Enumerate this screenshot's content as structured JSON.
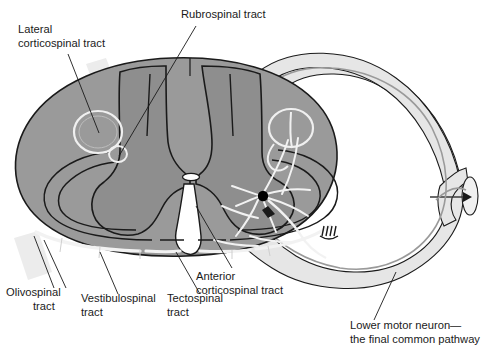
{
  "figure": {
    "background_color": "#ffffff"
  },
  "colors": {
    "white_matter": "#9a9a9a",
    "gray_matter": "#8e8e8e",
    "nerve_root": "#e6e6e6",
    "tract_highlight": "#ececec",
    "outline": "#1a1a1a",
    "tract_line": "#f2f2f2",
    "neuron_soma": "#000000",
    "label_text": "#1a1a1a",
    "leader_line": "#1a1a1a"
  },
  "labels": [
    {
      "id": "lateral-corticospinal-tract",
      "lines": [
        "Lateral",
        "corticospinal tract"
      ],
      "x": 18,
      "y": 33,
      "anchor": "start"
    },
    {
      "id": "rubrospinal-tract",
      "lines": [
        "Rubrospinal tract"
      ],
      "x": 181,
      "y": 18,
      "anchor": "start"
    },
    {
      "id": "anterior-corticospinal-tract",
      "lines": [
        "Anterior",
        "corticospinal tract"
      ],
      "x": 196,
      "y": 280,
      "anchor": "start"
    },
    {
      "id": "olivospinal-tract",
      "lines": [
        "Olivospinal",
        "tract"
      ],
      "x": 6,
      "y": 296,
      "anchor": "start"
    },
    {
      "id": "vestibulospinal-tract",
      "lines": [
        "Vestibulospinal",
        "tract"
      ],
      "x": 81,
      "y": 302,
      "anchor": "start"
    },
    {
      "id": "tectospinal-tract",
      "lines": [
        "Tectospinal",
        "tract"
      ],
      "x": 167,
      "y": 302,
      "anchor": "start"
    },
    {
      "id": "lower-motor-neuron",
      "lines": [
        "Lower motor neuron—",
        "the final common pathway"
      ],
      "x": 350,
      "y": 329,
      "anchor": "start"
    }
  ],
  "structures": [
    {
      "id": "white-matter",
      "name": "white matter"
    },
    {
      "id": "gray-matter",
      "name": "gray matter butterfly"
    },
    {
      "id": "posterior-horn-left",
      "name": "left posterior horn"
    },
    {
      "id": "posterior-horn-right",
      "name": "right posterior horn"
    },
    {
      "id": "anterior-horn-left",
      "name": "left anterior horn"
    },
    {
      "id": "anterior-horn-right",
      "name": "right anterior horn"
    },
    {
      "id": "central-canal",
      "name": "central canal"
    },
    {
      "id": "anterior-median-fissure",
      "name": "anterior median fissure"
    },
    {
      "id": "posterior-median-sulcus",
      "name": "posterior median sulcus"
    },
    {
      "id": "motor-neuron-soma",
      "name": "lower motor neuron cell body"
    },
    {
      "id": "ventral-root",
      "name": "ventral nerve root"
    },
    {
      "id": "spinal-nerve",
      "name": "spinal nerve cut end"
    },
    {
      "id": "motor-end-plate",
      "name": "motor end plate"
    }
  ]
}
